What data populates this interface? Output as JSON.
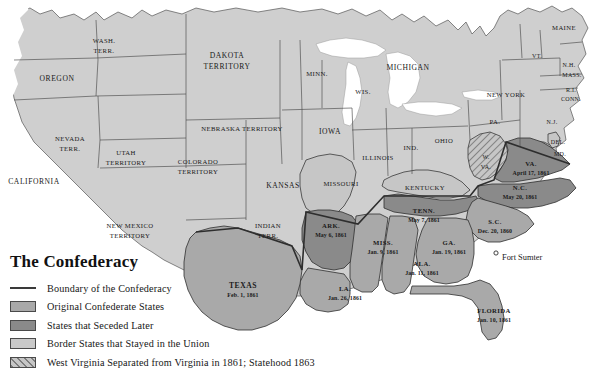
{
  "map": {
    "title": "The Confederacy",
    "colors": {
      "original_confederate": "#a9a9a9",
      "seceded_later": "#8a8a8a",
      "border_state": "#c6c6c6",
      "union": "#cfcfcf",
      "water": "#ffffff",
      "outline": "#555555",
      "boundary_line": "#3a3a3a"
    },
    "marker": {
      "fort_sumter": "Fort Sumter"
    }
  },
  "legend": {
    "title": "The Confederacy",
    "items": [
      {
        "swatch": "line",
        "label": "Boundary of the Confederacy"
      },
      {
        "swatch": "original",
        "label": "Original Confederate States"
      },
      {
        "swatch": "seceded-later",
        "label": "States that Seceded Later"
      },
      {
        "swatch": "border-state",
        "label": "Border States that Stayed in the Union"
      },
      {
        "swatch": "hatched",
        "label": "West Virginia Separated from Virginia in 1861; Statehood 1863"
      }
    ]
  },
  "regions": [
    {
      "id": "washington-territory",
      "name": "WASH.\nTERR.",
      "category": "union"
    },
    {
      "id": "oregon",
      "name": "OREGON",
      "category": "union"
    },
    {
      "id": "california",
      "name": "CALIFORNIA",
      "category": "union"
    },
    {
      "id": "nevada-territory",
      "name": "NEVADA\nTERR.",
      "category": "union"
    },
    {
      "id": "utah-territory",
      "name": "UTAH\nTERRITORY",
      "category": "union"
    },
    {
      "id": "colorado-territory",
      "name": "COLORADO\nTERRITORY",
      "category": "union"
    },
    {
      "id": "new-mexico-territory",
      "name": "NEW MEXICO\nTERRITORY",
      "category": "union"
    },
    {
      "id": "dakota-territory",
      "name": "DAKOTA\nTERRITORY",
      "category": "union"
    },
    {
      "id": "nebraska-territory",
      "name": "NEBRASKA TERRITORY",
      "category": "union"
    },
    {
      "id": "kansas",
      "name": "KANSAS",
      "category": "union"
    },
    {
      "id": "indian-territory",
      "name": "INDIAN\nTERR.",
      "category": "union"
    },
    {
      "id": "minnesota",
      "name": "MINN.",
      "category": "union"
    },
    {
      "id": "wisconsin",
      "name": "WIS.",
      "category": "union"
    },
    {
      "id": "iowa",
      "name": "IOWA",
      "category": "union"
    },
    {
      "id": "michigan",
      "name": "MICHIGAN",
      "category": "union"
    },
    {
      "id": "illinois",
      "name": "ILLINOIS",
      "category": "union"
    },
    {
      "id": "indiana",
      "name": "IND.",
      "category": "union"
    },
    {
      "id": "ohio",
      "name": "OHIO",
      "category": "union"
    },
    {
      "id": "pennsylvania",
      "name": "PA.",
      "category": "union"
    },
    {
      "id": "new-york",
      "name": "NEW YORK",
      "category": "union"
    },
    {
      "id": "maine",
      "name": "MAINE",
      "category": "union"
    },
    {
      "id": "vermont",
      "name": "VT.",
      "category": "union"
    },
    {
      "id": "new-hampshire",
      "name": "N.H.",
      "category": "union"
    },
    {
      "id": "massachusetts",
      "name": "MASS.",
      "category": "union"
    },
    {
      "id": "rhode-island",
      "name": "R.I.",
      "category": "union"
    },
    {
      "id": "connecticut",
      "name": "CONN.",
      "category": "union"
    },
    {
      "id": "new-jersey",
      "name": "N.J.",
      "category": "union"
    },
    {
      "id": "delaware",
      "name": "DEL.",
      "category": "border"
    },
    {
      "id": "maryland",
      "name": "MD.",
      "category": "border"
    },
    {
      "id": "missouri",
      "name": "MISSOURI",
      "category": "border"
    },
    {
      "id": "kentucky",
      "name": "KENTUCKY",
      "category": "border"
    },
    {
      "id": "west-virginia",
      "name": "W.\nVA.",
      "category": "hatched"
    }
  ],
  "confederate_states": [
    {
      "id": "virginia",
      "name": "VA.",
      "date": "April 17, 1861",
      "category": "seceded-later"
    },
    {
      "id": "north-carolina",
      "name": "N.C.",
      "date": "May 20, 1861",
      "category": "seceded-later"
    },
    {
      "id": "tennessee",
      "name": "TENN.",
      "date": "May 7, 1861",
      "category": "seceded-later"
    },
    {
      "id": "arkansas",
      "name": "ARK.",
      "date": "May 6, 1861",
      "category": "seceded-later"
    },
    {
      "id": "south-carolina",
      "name": "S.C.",
      "date": "Dec. 20, 1860",
      "category": "original"
    },
    {
      "id": "georgia",
      "name": "GA.",
      "date": "Jan. 19, 1861",
      "category": "original"
    },
    {
      "id": "alabama",
      "name": "ALA.",
      "date": "Jan. 11, 1861",
      "category": "original"
    },
    {
      "id": "mississippi",
      "name": "MISS.",
      "date": "Jan. 9, 1861",
      "category": "original"
    },
    {
      "id": "florida",
      "name": "FLORIDA",
      "date": "Jan. 10, 1861",
      "category": "original"
    },
    {
      "id": "louisiana",
      "name": "LA.",
      "date": "Jan. 26, 1861",
      "category": "original"
    },
    {
      "id": "texas",
      "name": "TEXAS",
      "date": "Feb. 1, 1861",
      "category": "original"
    }
  ],
  "labels": {
    "wash_terr_1": "WASH.",
    "wash_terr_2": "TERR.",
    "oregon": "OREGON",
    "california": "CALIFORNIA",
    "nevada_1": "NEVADA",
    "nevada_2": "TERR.",
    "utah_1": "UTAH",
    "utah_2": "TERRITORY",
    "colorado_1": "COLORADO",
    "colorado_2": "TERRITORY",
    "newmexico_1": "NEW MEXICO",
    "newmexico_2": "TERRITORY",
    "dakota_1": "DAKOTA",
    "dakota_2": "TERRITORY",
    "nebraska": "NEBRASKA TERRITORY",
    "kansas": "KANSAS",
    "indian_1": "INDIAN",
    "indian_2": "TERR.",
    "minn": "MINN.",
    "wis": "WIS.",
    "iowa": "IOWA",
    "michigan": "MICHIGAN",
    "illinois": "ILLINOIS",
    "ind": "IND.",
    "ohio": "OHIO",
    "pa": "PA.",
    "newyork": "NEW YORK",
    "maine": "MAINE",
    "vt": "VT.",
    "nh": "N.H.",
    "mass": "MASS.",
    "ri": "R.I.",
    "conn": "CONN.",
    "nj": "N.J.",
    "del": "DEL.",
    "md": "MD.",
    "missouri": "MISSOURI",
    "kentucky": "KENTUCKY",
    "wva_1": "W.",
    "wva_2": "VA.",
    "va": "VA.",
    "va_date": "April 17, 1861",
    "nc": "N.C.",
    "nc_date": "May 20, 1861",
    "tenn": "TENN.",
    "tenn_date": "May 7, 1861",
    "ark": "ARK.",
    "ark_date": "May 6, 1861",
    "sc": "S.C.",
    "sc_date": "Dec. 20, 1860",
    "ga": "GA.",
    "ga_date": "Jan. 19, 1861",
    "ala": "ALA.",
    "ala_date": "Jan. 11, 1861",
    "miss": "MISS.",
    "miss_date": "Jan. 9, 1861",
    "florida": "FLORIDA",
    "florida_date": "Jan. 10, 1861",
    "la": "LA.",
    "la_date": "Jan. 26, 1861",
    "texas": "TEXAS",
    "texas_date": "Feb. 1, 1861",
    "fort_sumter": "Fort Sumter"
  }
}
